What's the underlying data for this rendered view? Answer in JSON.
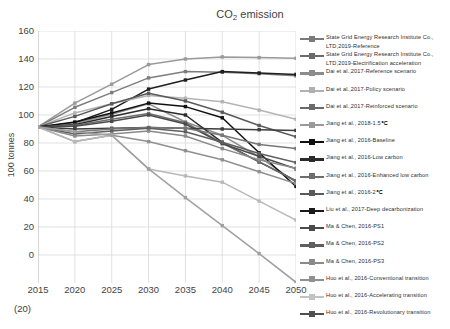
{
  "chart": {
    "title_main": "CO",
    "title_sub": "2",
    "title_tail": " emission",
    "title_full": "CO2 emission",
    "ylabel": "100 tonnes",
    "y_below_zero_label": "(20)"
  },
  "chart_data": {
    "type": "line",
    "title": "CO2 emission",
    "xlabel": "",
    "ylabel": "100 tonnes",
    "x": [
      2015,
      2020,
      2025,
      2030,
      2035,
      2040,
      2045,
      2050
    ],
    "xlim": [
      2015,
      2050
    ],
    "ylim": [
      -20,
      160
    ],
    "yticks": [
      0,
      20,
      40,
      60,
      80,
      100,
      120,
      140,
      160
    ],
    "xticks": [
      "2015",
      "2020",
      "2025",
      "2030",
      "2035",
      "2040",
      "2045",
      "2050"
    ],
    "grid": true,
    "legend_position": "right",
    "series": [
      {
        "name": "State Grid Energy Research Institute Co., LTD,2019-Reference",
        "color": "#9a9a9a",
        "values": [
          91.5,
          108.5,
          122.0,
          136.0,
          140.0,
          141.5,
          141.0,
          140.5
        ]
      },
      {
        "name": "State Grid Energy Research Institute Co., LTD,2019-Electrification acceleration",
        "color": "#7d7d7d",
        "values": [
          91.5,
          105.5,
          116.0,
          126.5,
          131.0,
          130.5,
          129.5,
          128.0
        ]
      },
      {
        "name": "Dai et al.,2017-Reference scenario",
        "color": "#1f1f1f",
        "values": [
          91.5,
          94.5,
          104.0,
          118.5,
          125.0,
          131.0,
          130.0,
          129.0
        ]
      },
      {
        "name": "Dai et al.,2017-Policy scenario",
        "color": "#b4b4b4",
        "values": [
          91.5,
          101.5,
          108.0,
          114.0,
          112.0,
          109.5,
          103.5,
          97.0
        ]
      },
      {
        "name": "Dai et al.,2017-Reinforced scenario",
        "color": "#5a5a5a",
        "values": [
          91.5,
          99.0,
          108.0,
          115.5,
          110.0,
          102.0,
          92.5,
          84.5
        ]
      },
      {
        "name": "Jiang et al., 2018-1.5℃",
        "color": "#8e8e8e",
        "values": [
          91.5,
          94.0,
          100.5,
          108.0,
          95.0,
          85.5,
          70.0,
          52.0
        ]
      },
      {
        "name": "Jiang et al., 2016-Baseline",
        "color": "#111111",
        "values": [
          91.5,
          95.0,
          101.5,
          108.5,
          106.0,
          98.0,
          73.0,
          49.0
        ]
      },
      {
        "name": "Jiang et al., 2016-Low carbon",
        "color": "#2b2b2b",
        "values": [
          91.5,
          93.0,
          99.0,
          104.5,
          100.0,
          80.5,
          66.5,
          53.0
        ]
      },
      {
        "name": "Jiang et al., 2016-Enhanced low carbon",
        "color": "#6e6e6e",
        "values": [
          91.5,
          92.5,
          97.0,
          101.0,
          94.5,
          80.0,
          66.5,
          53.0
        ]
      },
      {
        "name": "Jiang et al., 2016-2℃",
        "color": "#4a4a4a",
        "values": [
          91.5,
          92.0,
          95.5,
          100.0,
          93.5,
          79.5,
          70.5,
          61.5
        ]
      },
      {
        "name": "Liu et al., 2017-Deep decarbonization",
        "color": "#3d3d3d",
        "values": [
          91.5,
          90.0,
          90.5,
          91.0,
          90.5,
          90.0,
          89.5,
          89.0
        ]
      },
      {
        "name": "Ma & Chen, 2016-PS1",
        "color": "#777777",
        "values": [
          91.5,
          88.0,
          90.0,
          91.0,
          90.5,
          85.5,
          79.0,
          76.0
        ]
      },
      {
        "name": "Ma & Chen, 2016-PS2",
        "color": "#5f5f5f",
        "values": [
          91.5,
          86.5,
          88.5,
          90.5,
          88.0,
          80.5,
          72.5,
          66.0
        ]
      },
      {
        "name": "Ma & Chen, 2016-PS3",
        "color": "#8a8a8a",
        "values": [
          91.5,
          85.0,
          86.5,
          88.5,
          85.0,
          76.0,
          68.0,
          62.0
        ]
      },
      {
        "name": "Huo et al., 2016-Conventional transition",
        "color": "#909090",
        "values": [
          91.5,
          81.0,
          85.5,
          81.0,
          74.5,
          68.0,
          59.5,
          51.0
        ]
      },
      {
        "name": "Huo et al., 2016-Accelerating transition",
        "color": "#b8b8b8",
        "values": [
          91.5,
          81.0,
          85.5,
          61.5,
          56.5,
          52.0,
          38.5,
          25.0
        ]
      },
      {
        "name": "Huo et al., 2016-Revolutionary transition",
        "color": "#a0a0a0",
        "values": [
          91.5,
          88.0,
          85.5,
          61.5,
          41.0,
          21.0,
          1.0,
          -19.5
        ]
      }
    ]
  },
  "legend": {
    "items": [
      {
        "label": "State Grid Energy Research Institute Co., LTD,2019-Reference",
        "color": "#7a7a7a"
      },
      {
        "label": "State Grid Energy Research Institute Co., LTD,2019-Electrification acceleration",
        "color": "#6b6b6b"
      },
      {
        "label": "Dai et al.,2017-Reference scenario",
        "color": "#8c8c8c"
      },
      {
        "label": "Dai et al.,2017-Policy scenario",
        "color": "#b0b0b0"
      },
      {
        "label": "Dai et al.,2017-Reinforced scenario",
        "color": "#6a6a6a"
      },
      {
        "label": "Jiang et al., 2018-1.5℃",
        "color": "#9a9a9a"
      },
      {
        "label": "Jiang et al., 2016-Baseline",
        "color": "#111111"
      },
      {
        "label": "Jiang et al., 2016-Low carbon",
        "color": "#2b2b2b"
      },
      {
        "label": "Jiang et al., 2016-Enhanced low carbon",
        "color": "#6e6e6e"
      },
      {
        "label": "Jiang et al., 2016-2℃",
        "color": "#5a5a5a"
      },
      {
        "label": "Liu et al., 2017-Deep decarbonization",
        "color": "#1a1a1a"
      },
      {
        "label": "Ma & Chen, 2016-PS1",
        "color": "#4a4a4a"
      },
      {
        "label": "Ma & Chen, 2016-PS2",
        "color": "#5f5f5f"
      },
      {
        "label": "Ma & Chen, 2016-PS3",
        "color": "#8a8a8a"
      },
      {
        "label": "Huo et al., 2016-Conventional transition",
        "color": "#909090"
      },
      {
        "label": "Huo et al., 2016-Accelerating transition",
        "color": "#c2c2c2"
      },
      {
        "label": "Huo et al., 2016-Revolutionary transition",
        "color": "#4f4f4f"
      }
    ]
  }
}
